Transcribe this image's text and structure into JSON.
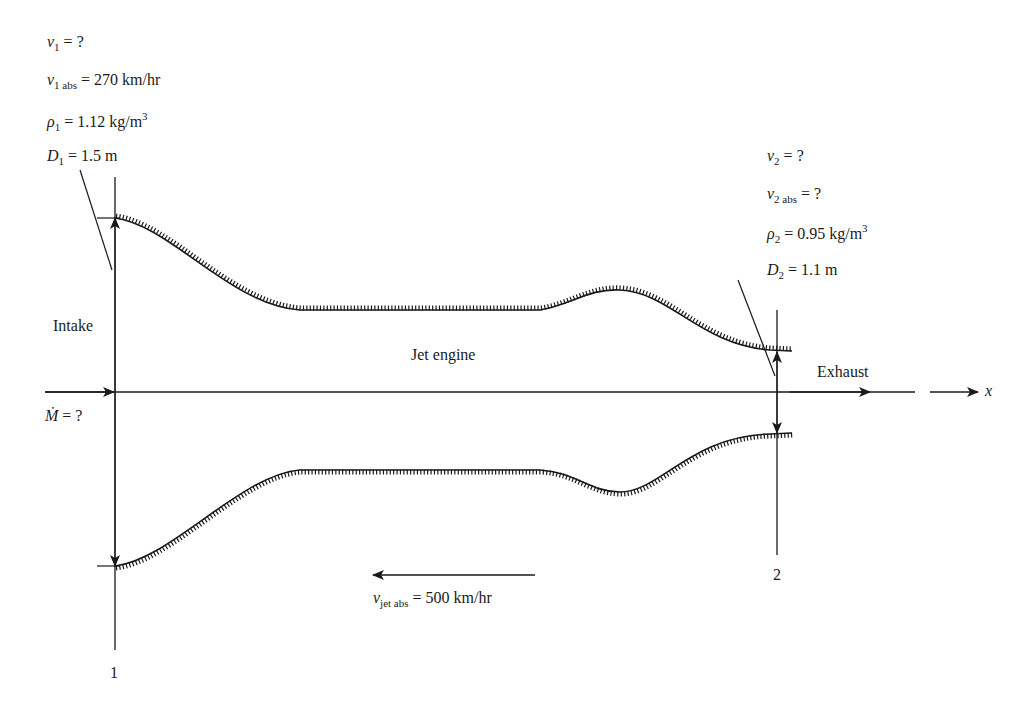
{
  "figure": {
    "station1": {
      "number": "1",
      "label": "Intake",
      "annotations": [
        {
          "sym": "ν",
          "sub": "1",
          "rhs": "?"
        },
        {
          "sym": "ν",
          "sub": "1 abs",
          "rhs": "270 km/hr"
        },
        {
          "sym": "ρ",
          "sub": "1",
          "rhs": "1.12 kg/m",
          "sup": "3"
        },
        {
          "sym": "D",
          "sub": "1",
          "rhs": "1.5 m"
        }
      ]
    },
    "station2": {
      "number": "2",
      "label": "Exhaust",
      "annotations": [
        {
          "sym": "ν",
          "sub": "2",
          "rhs": "?"
        },
        {
          "sym": "ν",
          "sub": "2 abs",
          "rhs": "?"
        },
        {
          "sym": "ρ",
          "sub": "2",
          "rhs": "0.95 kg/m",
          "sup": "3"
        },
        {
          "sym": "D",
          "sub": "2",
          "rhs": "1.1 m"
        }
      ]
    },
    "center_label": "Jet engine",
    "mass_flow": {
      "sym": "Ṁ",
      "rhs": "?"
    },
    "jet_velocity": {
      "sym": "ν",
      "sub": "jet abs",
      "rhs": "500 km/hr",
      "direction": "left"
    },
    "axis_label": "x",
    "equals": "="
  }
}
